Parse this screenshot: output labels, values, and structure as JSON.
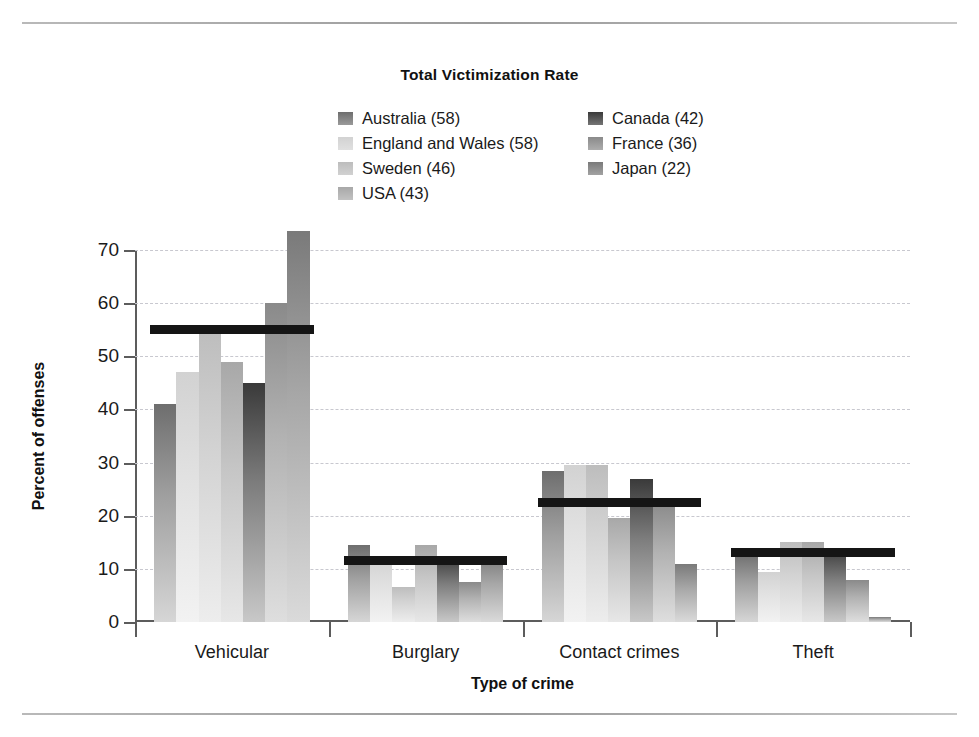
{
  "chart_data": {
    "type": "bar",
    "title": "Total Victimization Rate",
    "xlabel": "Type of crime",
    "ylabel": "Percent of offenses",
    "ylim": [
      0,
      70
    ],
    "yticks": [
      0,
      10,
      20,
      30,
      40,
      50,
      60,
      70
    ],
    "grid": true,
    "legend_position": "top-center",
    "categories": [
      "Vehicular",
      "Burglary",
      "Contact crimes",
      "Theft"
    ],
    "series": [
      {
        "name": "Australia (58)",
        "color": "#6e6e6e",
        "values": [
          41.0,
          14.5,
          28.5,
          13.0
        ]
      },
      {
        "name": "England and Wales (58)",
        "color": "#d2d2d2",
        "values": [
          47.0,
          12.0,
          29.5,
          9.5
        ]
      },
      {
        "name": "Sweden (46)",
        "color": "#bdbdbd",
        "values": [
          55.0,
          6.5,
          29.5,
          15.0
        ]
      },
      {
        "name": "USA (43)",
        "color": "#a8a8a8",
        "values": [
          49.0,
          14.5,
          19.5,
          15.0
        ]
      },
      {
        "name": "Canada (42)",
        "color": "#3a3a3a",
        "values": [
          45.0,
          12.5,
          27.0,
          14.0
        ]
      },
      {
        "name": "France (36)",
        "color": "#8a8a8a",
        "values": [
          60.0,
          7.5,
          22.5,
          8.0
        ]
      },
      {
        "name": "Japan (22)",
        "color": "#7a7a7a",
        "values": [
          73.5,
          12.5,
          11.0,
          1.0
        ]
      }
    ],
    "mean_lines": {
      "label": "Total victimization rate",
      "color": "#151515",
      "values": [
        55.0,
        11.5,
        22.5,
        13.0
      ]
    }
  },
  "legend": {
    "items": [
      {
        "label": "Australia (58)"
      },
      {
        "label": "Canada (42)"
      },
      {
        "label": "England and Wales (58)"
      },
      {
        "label": "France (36)"
      },
      {
        "label": "Sweden (46)"
      },
      {
        "label": "Japan (22)"
      },
      {
        "label": "USA (43)"
      }
    ]
  }
}
